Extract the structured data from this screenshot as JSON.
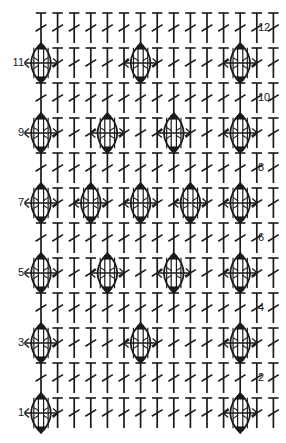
{
  "chart_data": {
    "type": "table",
    "title": "",
    "subtitle": "",
    "xlabel": "",
    "ylabel": "",
    "grid": false,
    "legend_position": "none",
    "columns": 15,
    "rows": 12,
    "stitch_symbols": {
      "dc": "double-crochet",
      "puff": "puff-stitch"
    },
    "row_label_side": {
      "odd": "left",
      "even": "right"
    },
    "row_labels_left": [
      "11",
      "9",
      "7",
      "5",
      "3",
      "1"
    ],
    "row_labels_right": [
      "12",
      "10",
      "8",
      "6",
      "4",
      "2"
    ],
    "rows_data": [
      {
        "row": 12,
        "label": "12",
        "label_side": "right",
        "puff_columns": [],
        "stitches": [
          "dc",
          "dc",
          "dc",
          "dc",
          "dc",
          "dc",
          "dc",
          "dc",
          "dc",
          "dc",
          "dc",
          "dc",
          "dc",
          "dc",
          "dc"
        ]
      },
      {
        "row": 11,
        "label": "11",
        "label_side": "left",
        "puff_columns": [
          1,
          7,
          13
        ],
        "stitches": [
          "puff",
          "dc",
          "dc",
          "dc",
          "dc",
          "dc",
          "puff",
          "dc",
          "dc",
          "dc",
          "dc",
          "dc",
          "puff",
          "dc",
          "dc"
        ]
      },
      {
        "row": 10,
        "label": "10",
        "label_side": "right",
        "puff_columns": [],
        "stitches": [
          "dc",
          "dc",
          "dc",
          "dc",
          "dc",
          "dc",
          "dc",
          "dc",
          "dc",
          "dc",
          "dc",
          "dc",
          "dc",
          "dc",
          "dc"
        ]
      },
      {
        "row": 9,
        "label": "9",
        "label_side": "left",
        "puff_columns": [
          1,
          5,
          9,
          13
        ],
        "stitches": [
          "puff",
          "dc",
          "dc",
          "dc",
          "puff",
          "dc",
          "dc",
          "dc",
          "puff",
          "dc",
          "dc",
          "dc",
          "puff",
          "dc",
          "dc"
        ]
      },
      {
        "row": 8,
        "label": "8",
        "label_side": "right",
        "puff_columns": [],
        "stitches": [
          "dc",
          "dc",
          "dc",
          "dc",
          "dc",
          "dc",
          "dc",
          "dc",
          "dc",
          "dc",
          "dc",
          "dc",
          "dc",
          "dc",
          "dc"
        ]
      },
      {
        "row": 7,
        "label": "7",
        "label_side": "left",
        "puff_columns": [
          1,
          4,
          7,
          10,
          13
        ],
        "stitches": [
          "puff",
          "dc",
          "dc",
          "puff",
          "dc",
          "dc",
          "puff",
          "dc",
          "dc",
          "puff",
          "dc",
          "dc",
          "puff",
          "dc",
          "dc"
        ]
      },
      {
        "row": 6,
        "label": "6",
        "label_side": "right",
        "puff_columns": [],
        "stitches": [
          "dc",
          "dc",
          "dc",
          "dc",
          "dc",
          "dc",
          "dc",
          "dc",
          "dc",
          "dc",
          "dc",
          "dc",
          "dc",
          "dc",
          "dc"
        ]
      },
      {
        "row": 5,
        "label": "5",
        "label_side": "left",
        "puff_columns": [
          1,
          5,
          9,
          13
        ],
        "stitches": [
          "puff",
          "dc",
          "dc",
          "dc",
          "puff",
          "dc",
          "dc",
          "dc",
          "puff",
          "dc",
          "dc",
          "dc",
          "puff",
          "dc",
          "dc"
        ]
      },
      {
        "row": 4,
        "label": "4",
        "label_side": "right",
        "puff_columns": [],
        "stitches": [
          "dc",
          "dc",
          "dc",
          "dc",
          "dc",
          "dc",
          "dc",
          "dc",
          "dc",
          "dc",
          "dc",
          "dc",
          "dc",
          "dc",
          "dc"
        ]
      },
      {
        "row": 3,
        "label": "3",
        "label_side": "left",
        "puff_columns": [
          1,
          7,
          13
        ],
        "stitches": [
          "puff",
          "dc",
          "dc",
          "dc",
          "dc",
          "dc",
          "puff",
          "dc",
          "dc",
          "dc",
          "dc",
          "dc",
          "puff",
          "dc",
          "dc"
        ]
      },
      {
        "row": 2,
        "label": "2",
        "label_side": "right",
        "puff_columns": [],
        "stitches": [
          "dc",
          "dc",
          "dc",
          "dc",
          "dc",
          "dc",
          "dc",
          "dc",
          "dc",
          "dc",
          "dc",
          "dc",
          "dc",
          "dc",
          "dc"
        ]
      },
      {
        "row": 1,
        "label": "1",
        "label_side": "left",
        "puff_columns": [
          1,
          13
        ],
        "stitches": [
          "puff",
          "dc",
          "dc",
          "dc",
          "dc",
          "dc",
          "dc",
          "dc",
          "dc",
          "dc",
          "dc",
          "dc",
          "puff",
          "dc",
          "dc"
        ]
      }
    ]
  },
  "colors": {
    "stroke": "#1a1a1a",
    "background": "#ffffff",
    "label": "#1a1a1a"
  },
  "geometry": {
    "col_step": 16.6,
    "col_origin": 41,
    "row_step": 35,
    "row_origin": 28,
    "dc_height": 30,
    "puff_width": 26,
    "puff_height": 40
  }
}
